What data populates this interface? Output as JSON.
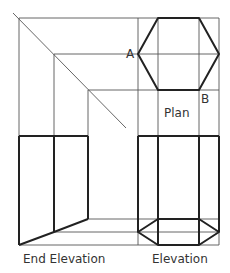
{
  "diagram": {
    "labels": {
      "point_a": "A",
      "point_b": "B",
      "plan": "Plan",
      "end_elevation": "End Elevation",
      "elevation": "Elevation"
    },
    "colors": {
      "line": "#222222",
      "construction_line": "#555555",
      "background": "#ffffff"
    }
  }
}
